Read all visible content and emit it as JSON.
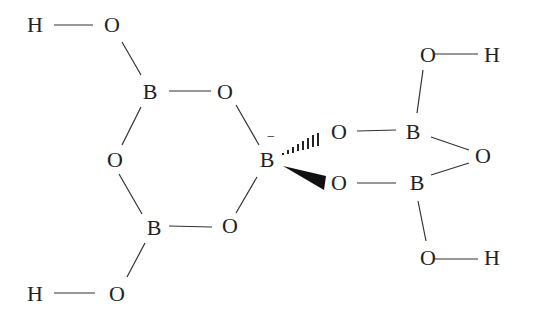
{
  "diagram": {
    "title": "",
    "atoms": [
      {
        "id": "H1",
        "label": "H",
        "x": 35,
        "y": 25
      },
      {
        "id": "O1",
        "label": "O",
        "x": 112,
        "y": 25
      },
      {
        "id": "B1",
        "label": "B",
        "x": 150,
        "y": 92
      },
      {
        "id": "O2",
        "label": "O",
        "x": 225,
        "y": 92
      },
      {
        "id": "O3",
        "label": "O",
        "x": 115,
        "y": 160
      },
      {
        "id": "B2",
        "label": "B",
        "x": 267,
        "y": 160
      },
      {
        "id": "B3",
        "label": "B",
        "x": 154,
        "y": 228
      },
      {
        "id": "O4",
        "label": "O",
        "x": 230,
        "y": 226
      },
      {
        "id": "H2",
        "label": "H",
        "x": 35,
        "y": 294
      },
      {
        "id": "O5",
        "label": "O",
        "x": 117,
        "y": 294
      },
      {
        "id": "O6",
        "label": "O",
        "x": 339,
        "y": 132
      },
      {
        "id": "B4",
        "label": "B",
        "x": 413,
        "y": 132
      },
      {
        "id": "O7",
        "label": "O",
        "x": 428,
        "y": 55
      },
      {
        "id": "H3",
        "label": "H",
        "x": 492,
        "y": 55
      },
      {
        "id": "O8",
        "label": "O",
        "x": 483,
        "y": 156
      },
      {
        "id": "O9",
        "label": "O",
        "x": 339,
        "y": 183
      },
      {
        "id": "B5",
        "label": "B",
        "x": 417,
        "y": 183
      },
      {
        "id": "O10",
        "label": "O",
        "x": 428,
        "y": 258
      },
      {
        "id": "H4",
        "label": "H",
        "x": 492,
        "y": 258
      }
    ],
    "charge": {
      "atom": "B2",
      "symbol": "−",
      "x": 271,
      "y": 138
    },
    "bonds": [
      {
        "from": "H1",
        "to": "O1",
        "type": "single"
      },
      {
        "from": "O1",
        "to": "B1",
        "type": "single"
      },
      {
        "from": "B1",
        "to": "O2",
        "type": "single"
      },
      {
        "from": "B1",
        "to": "O3",
        "type": "single"
      },
      {
        "from": "O2",
        "to": "B2",
        "type": "single"
      },
      {
        "from": "O3",
        "to": "B3",
        "type": "single"
      },
      {
        "from": "B3",
        "to": "O4",
        "type": "single"
      },
      {
        "from": "O4",
        "to": "B2",
        "type": "single"
      },
      {
        "from": "B3",
        "to": "O5",
        "type": "single"
      },
      {
        "from": "O5",
        "to": "H2",
        "type": "single"
      },
      {
        "from": "B2",
        "to": "O6",
        "type": "hashed-wedge"
      },
      {
        "from": "B2",
        "to": "O9",
        "type": "solid-wedge"
      },
      {
        "from": "O6",
        "to": "B4",
        "type": "single"
      },
      {
        "from": "O9",
        "to": "B5",
        "type": "single"
      },
      {
        "from": "B4",
        "to": "O7",
        "type": "single"
      },
      {
        "from": "O7",
        "to": "H3",
        "type": "single"
      },
      {
        "from": "B4",
        "to": "O8",
        "type": "single"
      },
      {
        "from": "O8",
        "to": "B5",
        "type": "single"
      },
      {
        "from": "B5",
        "to": "O10",
        "type": "single"
      },
      {
        "from": "O10",
        "to": "H4",
        "type": "single"
      }
    ]
  }
}
